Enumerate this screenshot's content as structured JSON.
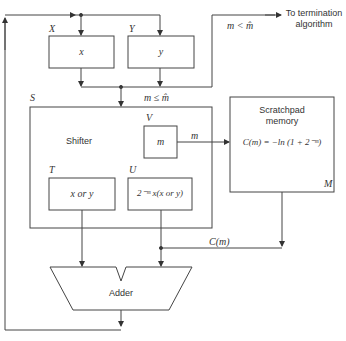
{
  "diagram": {
    "registers": {
      "x": {
        "name": "X",
        "content": "x"
      },
      "y": {
        "name": "Y",
        "content": "y"
      },
      "v": {
        "name": "V",
        "content": "m"
      },
      "t": {
        "name": "T",
        "content": "x or y"
      },
      "u": {
        "name": "U",
        "content": "2⁻ᵐ x(x or y)"
      }
    },
    "shifter": {
      "name": "S",
      "label": "Shifter"
    },
    "scratchpad": {
      "title_line1": "Scratchpad",
      "title_line2": "memory",
      "formula": "C(m) = −ln (1 + 2⁻ᵐ)",
      "name": "M"
    },
    "adder": {
      "label": "Adder"
    },
    "edges": {
      "m_le_mhat": "m ≤ m̂",
      "m_lt_mhat": "m < m̂",
      "termination_line1": "To termination",
      "termination_line2": "algorithm",
      "m_to_memory": "m",
      "c_m": "C(m)"
    }
  }
}
